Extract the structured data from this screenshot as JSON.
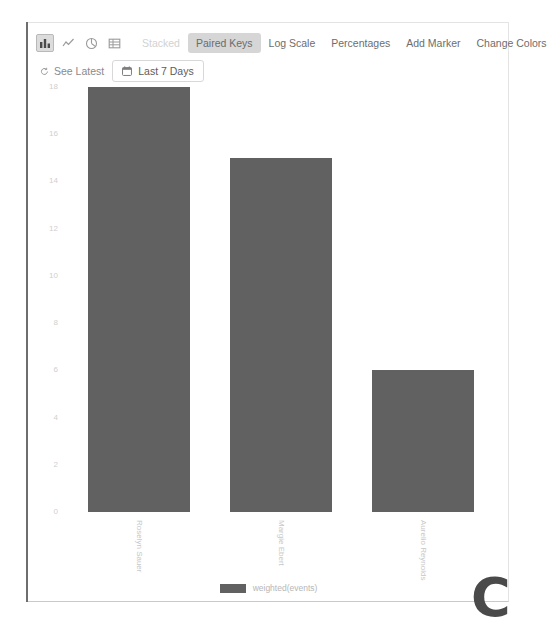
{
  "toolbar": {
    "chart_type_icons": [
      {
        "name": "bar-chart-icon",
        "active": true
      },
      {
        "name": "line-chart-icon",
        "active": false
      },
      {
        "name": "pie-chart-icon",
        "active": false
      },
      {
        "name": "table-icon",
        "active": false
      }
    ],
    "stacked_label": "Stacked",
    "paired_keys_label": "Paired Keys",
    "log_scale_label": "Log Scale",
    "percentages_label": "Percentages",
    "add_marker_label": "Add Marker",
    "change_colors_label": "Change Colors",
    "see_latest_label": "See Latest",
    "date_range_label": "Last 7 Days"
  },
  "legend": {
    "series_label": "weighted(events)",
    "swatch_color": "#616161"
  },
  "watermark": {
    "glyph": "C"
  },
  "chart_data": {
    "type": "bar",
    "title": "",
    "xlabel": "",
    "ylabel": "",
    "categories": [
      "Roselyn Sauer",
      "Margie Ebert",
      "Aurelio Reynolds"
    ],
    "values": [
      18,
      15,
      6
    ],
    "series": [
      {
        "name": "weighted(events)",
        "values": [
          18,
          15,
          6
        ],
        "color": "#616161"
      }
    ],
    "ylim": [
      0,
      18
    ],
    "yticks": [
      0,
      2,
      4,
      6,
      8,
      10,
      12,
      14,
      16,
      18
    ],
    "ytick_labels": [
      "0",
      "2",
      "4",
      "6",
      "8",
      "10",
      "12",
      "14",
      "16",
      "18"
    ],
    "grid": false,
    "legend_position": "bottom"
  }
}
